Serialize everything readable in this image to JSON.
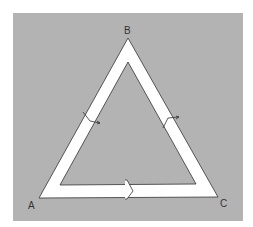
{
  "diagram": {
    "background_color": "#b3b3b3",
    "band_color": "#ffffff",
    "stroke_color": "#333333",
    "vertices": [
      {
        "id": "A",
        "label": "A"
      },
      {
        "id": "B",
        "label": "B"
      },
      {
        "id": "C",
        "label": "C"
      }
    ],
    "arrows": [
      {
        "edge": "A-B",
        "direction": "toward A"
      },
      {
        "edge": "B-C",
        "direction": "toward B"
      },
      {
        "edge": "A-C",
        "direction": "toward C"
      }
    ]
  }
}
